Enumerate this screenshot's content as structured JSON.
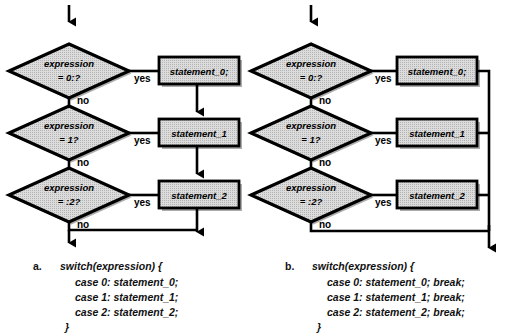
{
  "figure": {
    "colors": {
      "stroke": "#000000",
      "node_fill": "#d8d8d8",
      "shadow": "#555555",
      "background": "#ffffff"
    }
  },
  "panels": [
    {
      "id": "a",
      "caption_label": "a.",
      "decisions": [
        {
          "line1": "expression",
          "line2": "= 0:?"
        },
        {
          "line1": "expression",
          "line2": "= 1?"
        },
        {
          "line1": "expression",
          "line2": "= :2?"
        }
      ],
      "statements": [
        "statement_0;",
        "statement_1",
        "statement_2"
      ],
      "branch_yes_labels": [
        "yes",
        "yes",
        "yes"
      ],
      "branch_no_labels": [
        "no",
        "no",
        "no"
      ],
      "code_lines": [
        "switch(expression) {",
        "case 0: statement_0;",
        "case 1: statement_1;",
        "case 2: statement_2;",
        "}"
      ]
    },
    {
      "id": "b",
      "caption_label": "b.",
      "decisions": [
        {
          "line1": "expression",
          "line2": "= 0:?"
        },
        {
          "line1": "expression",
          "line2": "= 1?"
        },
        {
          "line1": "expression",
          "line2": "= :2?"
        }
      ],
      "statements": [
        "statement_0;",
        "statement_1",
        "statement_2"
      ],
      "branch_yes_labels": [
        "yes",
        "yes",
        "yes"
      ],
      "branch_no_labels": [
        "no",
        "no",
        "no"
      ],
      "code_lines": [
        "switch(expression) {",
        "case 0: statement_0; break;",
        "case 1: statement_1; break;",
        "case 2: statement_2; break;",
        "}"
      ]
    }
  ]
}
